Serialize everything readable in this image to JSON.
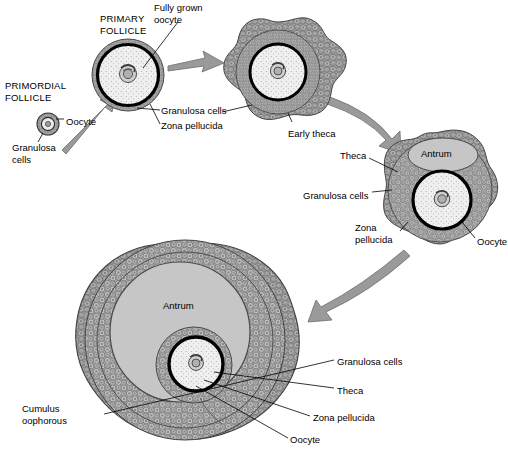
{
  "diagram": {
    "stages": [
      {
        "id": "primordial-follicle",
        "name": "PRIMORDIAL\nFOLLICLE",
        "cx": 48,
        "cy": 124,
        "r": 11
      },
      {
        "id": "primary-follicle",
        "name": "PRIMARY\nFOLLICLE",
        "cx": 128,
        "cy": 75,
        "r": 36
      },
      {
        "id": "secondary-follicle",
        "name": "Secondary follicle",
        "cx": 278,
        "cy": 72,
        "r": 50
      },
      {
        "id": "antral-follicle",
        "name": "Antral follicle",
        "cx": 440,
        "cy": 190,
        "r": 58
      },
      {
        "id": "mature-graafian-follicle",
        "name": "Mature follicle",
        "cx": 185,
        "cy": 357,
        "r": 112
      }
    ],
    "labels": [
      {
        "id": "primordial-follicle-title",
        "text": "PRIMORDIAL\nFOLLICLE",
        "x": 5,
        "y": 80,
        "caps": true
      },
      {
        "id": "primary-follicle-title",
        "text": "PRIMARY\nFOLLICLE",
        "x": 100,
        "y": 13,
        "caps": true
      },
      {
        "id": "fully-grown-oocyte",
        "text": "Fully grown\noocyte",
        "x": 154,
        "y": 2,
        "caps": false
      },
      {
        "id": "oocyte-primordial",
        "text": "Oocyte",
        "x": 66,
        "y": 116,
        "caps": false
      },
      {
        "id": "granulosa-cells-primordial",
        "text": "Granulosa\ncells",
        "x": 12,
        "y": 142,
        "caps": false
      },
      {
        "id": "granulosa-cells-primary",
        "text": "Granulosa cells",
        "x": 160,
        "y": 106,
        "caps": false
      },
      {
        "id": "zona-pellucida-primary",
        "text": "Zona pellucida",
        "x": 160,
        "y": 122,
        "caps": false
      },
      {
        "id": "early-theca",
        "text": "Early theca",
        "x": 288,
        "y": 128,
        "caps": false
      },
      {
        "id": "theca-antral",
        "text": "Theca",
        "x": 340,
        "y": 150,
        "caps": false
      },
      {
        "id": "antrum-antral",
        "text": "Antrum",
        "x": 421,
        "y": 147,
        "caps": false
      },
      {
        "id": "granulosa-cells-antral",
        "text": "Granulosa cells",
        "x": 303,
        "y": 190,
        "caps": false
      },
      {
        "id": "zona-pellucida-antral",
        "text": "Zona\npellucida",
        "x": 355,
        "y": 222,
        "caps": false
      },
      {
        "id": "oocyte-antral",
        "text": "Oocyte",
        "x": 477,
        "y": 236,
        "caps": false
      },
      {
        "id": "antrum-mature",
        "text": "Antrum",
        "x": 163,
        "y": 300,
        "caps": false
      },
      {
        "id": "cumulus-oophorous",
        "text": "Cumulus\noophorous",
        "x": 22,
        "y": 403,
        "caps": false
      },
      {
        "id": "granulosa-cells-mature",
        "text": "Granulosa cells",
        "x": 337,
        "y": 356,
        "caps": false
      },
      {
        "id": "theca-mature",
        "text": "Theca",
        "x": 337,
        "y": 385,
        "caps": false
      },
      {
        "id": "zona-pellucida-mature",
        "text": "Zona pellucida",
        "x": 313,
        "y": 412,
        "caps": false
      },
      {
        "id": "oocyte-mature",
        "text": "Oocyte",
        "x": 290,
        "y": 434,
        "caps": false
      }
    ],
    "arrows": [
      {
        "id": "arrow-primordial-to-primary",
        "from": "primordial-follicle",
        "to": "primary-follicle"
      },
      {
        "id": "arrow-primary-to-secondary",
        "from": "primary-follicle",
        "to": "secondary-follicle"
      },
      {
        "id": "arrow-secondary-to-antral",
        "from": "secondary-follicle",
        "to": "antral-follicle"
      },
      {
        "id": "arrow-antral-to-mature",
        "from": "antral-follicle",
        "to": "mature-graafian-follicle"
      }
    ],
    "colors": {
      "background": "#ffffff",
      "outline": "#000000",
      "arrow_fill": "#9a9a9a",
      "granulosa_fill": "#b5b5b5",
      "theca_fill": "#a0a0a0",
      "antrum_fill": "#c6c6c6",
      "oocyte_fill": "#efefef",
      "zona_pellucida": "#000000",
      "leader_line": "#000000"
    }
  }
}
